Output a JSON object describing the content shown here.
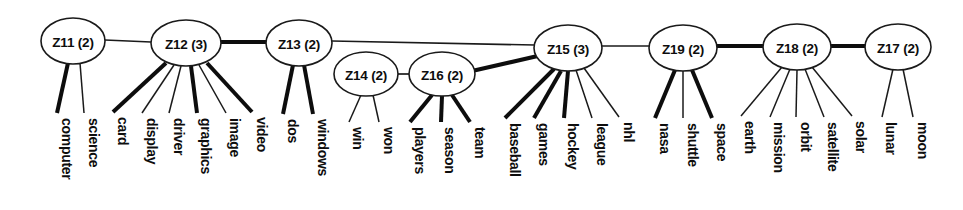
{
  "diagram": {
    "type": "cluster-dendrogram",
    "title": "",
    "background_color": "#ffffff",
    "line_color": "#1a1a1a",
    "text_color": "#0d0d0d",
    "clusters": [
      {
        "id": "Z11",
        "label": "Z11 (2)",
        "cx": 73,
        "cy": 41,
        "rx": 32,
        "ry": 23
      },
      {
        "id": "Z12",
        "label": "Z12 (3)",
        "cx": 186,
        "cy": 43,
        "rx": 35,
        "ry": 23
      },
      {
        "id": "Z13",
        "label": "Z13 (2)",
        "cx": 299,
        "cy": 43,
        "rx": 33,
        "ry": 23
      },
      {
        "id": "Z14",
        "label": "Z14 (2)",
        "cx": 366,
        "cy": 74,
        "rx": 32,
        "ry": 22
      },
      {
        "id": "Z16",
        "label": "Z16 (2)",
        "cx": 442,
        "cy": 74,
        "rx": 33,
        "ry": 22
      },
      {
        "id": "Z15",
        "label": "Z15 (3)",
        "cx": 568,
        "cy": 48,
        "rx": 34,
        "ry": 23
      },
      {
        "id": "Z19",
        "label": "Z19 (2)",
        "cx": 683,
        "cy": 48,
        "rx": 34,
        "ry": 23
      },
      {
        "id": "Z18",
        "label": "Z18 (2)",
        "cx": 797,
        "cy": 47,
        "rx": 34,
        "ry": 23
      },
      {
        "id": "Z17",
        "label": "Z17 (2)",
        "cx": 898,
        "cy": 47,
        "rx": 33,
        "ry": 23
      }
    ],
    "cluster_edges": [
      {
        "from": "Z11",
        "to": "Z12",
        "weight": "thin",
        "x1": 105,
        "y1": 40,
        "x2": 151,
        "y2": 42
      },
      {
        "from": "Z12",
        "to": "Z13",
        "weight": "thick",
        "x1": 221,
        "y1": 42,
        "x2": 266,
        "y2": 42
      },
      {
        "from": "Z13",
        "to": "Z15",
        "weight": "thin",
        "x1": 332,
        "y1": 41,
        "x2": 535,
        "y2": 45
      },
      {
        "from": "Z14",
        "to": "Z16",
        "weight": "thin",
        "x1": 398,
        "y1": 74,
        "x2": 409,
        "y2": 74
      },
      {
        "from": "Z16",
        "to": "Z15",
        "weight": "thick",
        "x1": 472,
        "y1": 71,
        "x2": 542,
        "y2": 55
      },
      {
        "from": "Z15",
        "to": "Z19",
        "weight": "thin",
        "x1": 602,
        "y1": 46,
        "x2": 649,
        "y2": 46
      },
      {
        "from": "Z19",
        "to": "Z18",
        "weight": "thick",
        "x1": 717,
        "y1": 46,
        "x2": 763,
        "y2": 46
      },
      {
        "from": "Z18",
        "to": "Z17",
        "weight": "thick",
        "x1": 831,
        "y1": 46,
        "x2": 865,
        "y2": 46
      }
    ],
    "leaves": [
      {
        "term": "computer",
        "parent": "Z11",
        "weight": "thick",
        "x1": 68,
        "y1": 63,
        "x2": 57,
        "y2": 113,
        "label_x": 62,
        "label_y": 118
      },
      {
        "term": "science",
        "parent": "Z11",
        "weight": "thin",
        "x1": 80,
        "y1": 63,
        "x2": 84,
        "y2": 113,
        "label_x": 89,
        "label_y": 118
      },
      {
        "term": "card",
        "parent": "Z12",
        "weight": "thick",
        "x1": 166,
        "y1": 63,
        "x2": 113,
        "y2": 112,
        "label_x": 118,
        "label_y": 117
      },
      {
        "term": "display",
        "parent": "Z12",
        "weight": "thin",
        "x1": 174,
        "y1": 65,
        "x2": 142,
        "y2": 113,
        "label_x": 147,
        "label_y": 118
      },
      {
        "term": "driver",
        "parent": "Z12",
        "weight": "thin",
        "x1": 181,
        "y1": 66,
        "x2": 169,
        "y2": 113,
        "label_x": 174,
        "label_y": 118
      },
      {
        "term": "graphics",
        "parent": "Z12",
        "weight": "thick",
        "x1": 191,
        "y1": 66,
        "x2": 197,
        "y2": 113,
        "label_x": 201,
        "label_y": 118
      },
      {
        "term": "image",
        "parent": "Z12",
        "weight": "thin",
        "x1": 199,
        "y1": 65,
        "x2": 226,
        "y2": 113,
        "label_x": 230,
        "label_y": 118
      },
      {
        "term": "video",
        "parent": "Z12",
        "weight": "thick",
        "x1": 207,
        "y1": 63,
        "x2": 252,
        "y2": 112,
        "label_x": 257,
        "label_y": 117
      },
      {
        "term": "dos",
        "parent": "Z13",
        "weight": "thick",
        "x1": 293,
        "y1": 65,
        "x2": 283,
        "y2": 114,
        "label_x": 288,
        "label_y": 119
      },
      {
        "term": "windows",
        "parent": "Z13",
        "weight": "thick",
        "x1": 304,
        "y1": 65,
        "x2": 313,
        "y2": 114,
        "label_x": 318,
        "label_y": 119
      },
      {
        "term": "win",
        "parent": "Z14",
        "weight": "thin",
        "x1": 361,
        "y1": 95,
        "x2": 349,
        "y2": 122,
        "label_x": 353,
        "label_y": 127
      },
      {
        "term": "won",
        "parent": "Z14",
        "weight": "thin",
        "x1": 373,
        "y1": 95,
        "x2": 379,
        "y2": 122,
        "label_x": 384,
        "label_y": 127
      },
      {
        "term": "players",
        "parent": "Z16",
        "weight": "thick",
        "x1": 432,
        "y1": 95,
        "x2": 410,
        "y2": 122,
        "label_x": 415,
        "label_y": 127
      },
      {
        "term": "season",
        "parent": "Z16",
        "weight": "thick",
        "x1": 442,
        "y1": 96,
        "x2": 441,
        "y2": 122,
        "label_x": 445,
        "label_y": 127
      },
      {
        "term": "team",
        "parent": "Z16",
        "weight": "thick",
        "x1": 452,
        "y1": 95,
        "x2": 470,
        "y2": 122,
        "label_x": 475,
        "label_y": 127
      },
      {
        "term": "baseball",
        "parent": "Z15",
        "weight": "thick",
        "x1": 554,
        "y1": 69,
        "x2": 505,
        "y2": 118,
        "label_x": 510,
        "label_y": 123
      },
      {
        "term": "games",
        "parent": "Z15",
        "weight": "thick",
        "x1": 561,
        "y1": 71,
        "x2": 534,
        "y2": 118,
        "label_x": 539,
        "label_y": 123
      },
      {
        "term": "hockey",
        "parent": "Z15",
        "weight": "thick",
        "x1": 568,
        "y1": 71,
        "x2": 564,
        "y2": 118,
        "label_x": 568,
        "label_y": 123
      },
      {
        "term": "league",
        "parent": "Z15",
        "weight": "thin",
        "x1": 576,
        "y1": 70,
        "x2": 592,
        "y2": 118,
        "label_x": 597,
        "label_y": 123
      },
      {
        "term": "nhl",
        "parent": "Z15",
        "weight": "thin",
        "x1": 584,
        "y1": 68,
        "x2": 619,
        "y2": 117,
        "label_x": 624,
        "label_y": 122
      },
      {
        "term": "nasa",
        "parent": "Z19",
        "weight": "thick",
        "x1": 675,
        "y1": 70,
        "x2": 655,
        "y2": 118,
        "label_x": 660,
        "label_y": 123
      },
      {
        "term": "shuttle",
        "parent": "Z19",
        "weight": "thin",
        "x1": 683,
        "y1": 71,
        "x2": 683,
        "y2": 118,
        "label_x": 688,
        "label_y": 123
      },
      {
        "term": "space",
        "parent": "Z19",
        "weight": "thick",
        "x1": 692,
        "y1": 70,
        "x2": 712,
        "y2": 118,
        "label_x": 717,
        "label_y": 123
      },
      {
        "term": "earth",
        "parent": "Z18",
        "weight": "thin",
        "x1": 782,
        "y1": 67,
        "x2": 741,
        "y2": 116,
        "label_x": 745,
        "label_y": 121
      },
      {
        "term": "mission",
        "parent": "Z18",
        "weight": "thin",
        "x1": 790,
        "y1": 69,
        "x2": 770,
        "y2": 117,
        "label_x": 774,
        "label_y": 122
      },
      {
        "term": "orbit",
        "parent": "Z18",
        "weight": "thin",
        "x1": 797,
        "y1": 70,
        "x2": 796,
        "y2": 117,
        "label_x": 801,
        "label_y": 122
      },
      {
        "term": "satellite",
        "parent": "Z18",
        "weight": "thin",
        "x1": 805,
        "y1": 69,
        "x2": 824,
        "y2": 117,
        "label_x": 828,
        "label_y": 122
      },
      {
        "term": "solar",
        "parent": "Z18",
        "weight": "thin",
        "x1": 812,
        "y1": 67,
        "x2": 852,
        "y2": 116,
        "label_x": 856,
        "label_y": 121
      },
      {
        "term": "lunar",
        "parent": "Z17",
        "weight": "thin",
        "x1": 893,
        "y1": 69,
        "x2": 882,
        "y2": 117,
        "label_x": 886,
        "label_y": 122
      },
      {
        "term": "moon",
        "parent": "Z17",
        "weight": "thin",
        "x1": 903,
        "y1": 69,
        "x2": 913,
        "y2": 117,
        "label_x": 918,
        "label_y": 122
      }
    ]
  }
}
